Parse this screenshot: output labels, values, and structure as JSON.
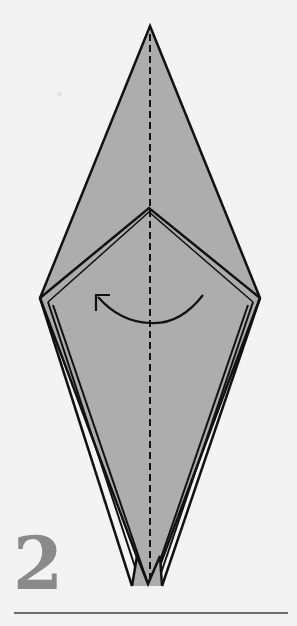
{
  "diagram": {
    "step_number": "2",
    "colors": {
      "paper_fill": "#adadad",
      "outline": "#111111",
      "fold_line": "#111111",
      "step_number": "#8a8a8a",
      "rule": "#6d6d6d",
      "background": "#f3f3f3"
    },
    "elements": [
      {
        "name": "folded-kite-shape",
        "description": "gray elongated diamond (bird base) with layered edges"
      },
      {
        "name": "valley-fold-line",
        "description": "vertical dashed centre line from top tip to bottom tip"
      },
      {
        "name": "inner-flap-v",
        "description": "inner chevron apex near center"
      },
      {
        "name": "turn-over-arrow",
        "description": "curved arrow pointing left, indicating fold flap from right to left"
      },
      {
        "name": "bottom-split-tips",
        "description": "two narrow points at bottom"
      }
    ]
  }
}
